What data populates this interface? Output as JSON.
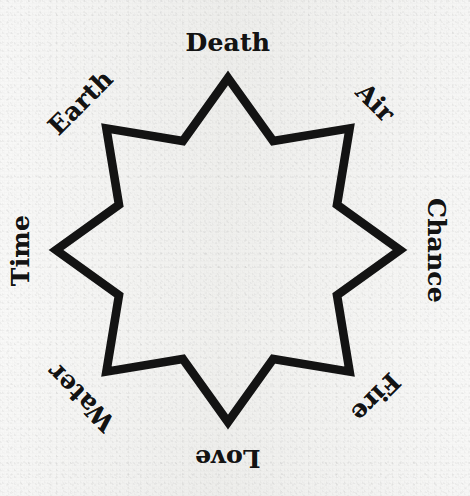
{
  "figure": {
    "type": "octagram",
    "ink_color": "#131313",
    "paper_color": "#f2f2f0",
    "center": {
      "x": 228,
      "y": 250
    },
    "outer_radius": 172,
    "inner_radius": 118,
    "stroke_width": 8.6,
    "point_count": 8
  },
  "labels": [
    {
      "text": "Death",
      "angle_deg": 0,
      "rotation_deg": 0,
      "position": "top",
      "point_index": 0
    },
    {
      "text": "Air",
      "angle_deg": 45,
      "rotation_deg": 45,
      "position": "top-right",
      "point_index": 1
    },
    {
      "text": "Chance",
      "angle_deg": 90,
      "rotation_deg": 90,
      "position": "right",
      "point_index": 2
    },
    {
      "text": "Fire",
      "angle_deg": 135,
      "rotation_deg": 135,
      "position": "bottom-right",
      "point_index": 3
    },
    {
      "text": "Love",
      "angle_deg": 180,
      "rotation_deg": 180,
      "position": "bottom",
      "point_index": 4
    },
    {
      "text": "Water",
      "angle_deg": 225,
      "rotation_deg": 225,
      "position": "bottom-left",
      "point_index": 5
    },
    {
      "text": "Time",
      "angle_deg": 270,
      "rotation_deg": 270,
      "position": "left",
      "point_index": 6
    },
    {
      "text": "Earth",
      "angle_deg": 315,
      "rotation_deg": 315,
      "position": "top-left",
      "point_index": 7
    }
  ]
}
